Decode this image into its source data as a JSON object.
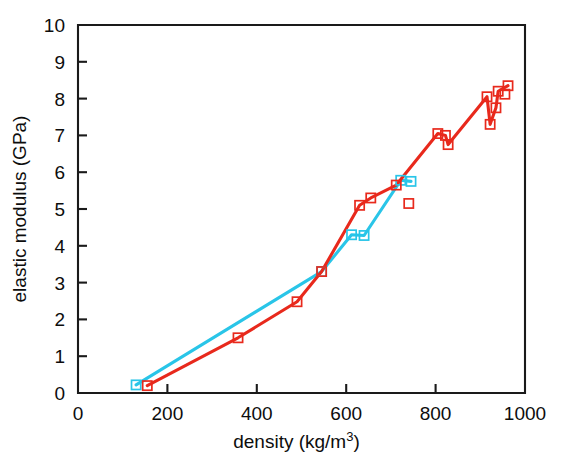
{
  "chart_data": {
    "type": "line",
    "title": "",
    "xlabel": "density (kg/m3)",
    "xlabel_base": "density (kg/m",
    "xlabel_sup": "3",
    "xlabel_tail": ")",
    "ylabel": "elastic modulus (GPa)",
    "xlim": [
      0,
      1000
    ],
    "ylim": [
      0,
      10
    ],
    "xticks": [
      0,
      200,
      400,
      600,
      800,
      1000
    ],
    "yticks": [
      0,
      1,
      2,
      3,
      4,
      5,
      6,
      7,
      8,
      9,
      10
    ],
    "xticklabels": [
      "0",
      "200",
      "400",
      "600",
      "800",
      "1000"
    ],
    "yticklabels": [
      "0",
      "1",
      "2",
      "3",
      "4",
      "5",
      "6",
      "7",
      "8",
      "9",
      "10"
    ],
    "grid": false,
    "legend": "none",
    "marker_shape": "open-square",
    "series": [
      {
        "name": "red-series",
        "color": "#E8291C",
        "points": [
          [
            155,
            0.2
          ],
          [
            358,
            1.5
          ],
          [
            490,
            2.48
          ],
          [
            545,
            3.3
          ],
          [
            630,
            5.1
          ],
          [
            655,
            5.3
          ],
          [
            712,
            5.65
          ],
          [
            740,
            5.15
          ],
          [
            805,
            7.05
          ],
          [
            822,
            7.0
          ],
          [
            828,
            6.75
          ],
          [
            915,
            8.05
          ],
          [
            922,
            7.3
          ],
          [
            935,
            7.75
          ],
          [
            940,
            8.2
          ],
          [
            955,
            8.12
          ],
          [
            962,
            8.35
          ]
        ],
        "path_order": [
          [
            155,
            0.2
          ],
          [
            358,
            1.5
          ],
          [
            490,
            2.48
          ],
          [
            545,
            3.3
          ],
          [
            630,
            5.1
          ],
          [
            655,
            5.3
          ],
          [
            712,
            5.65
          ],
          [
            805,
            7.05
          ],
          [
            822,
            7.0
          ],
          [
            828,
            6.75
          ],
          [
            915,
            8.05
          ],
          [
            922,
            7.3
          ],
          [
            935,
            7.75
          ],
          [
            940,
            8.2
          ],
          [
            962,
            8.35
          ]
        ],
        "isolated_points": [
          [
            740,
            5.15
          ],
          [
            955,
            8.12
          ]
        ]
      },
      {
        "name": "cyan-series",
        "color": "#29C5E8",
        "points": [
          [
            130,
            0.22
          ],
          [
            545,
            3.3
          ],
          [
            612,
            4.3
          ],
          [
            640,
            4.28
          ],
          [
            722,
            5.78
          ],
          [
            745,
            5.75
          ]
        ],
        "path_order": [
          [
            130,
            0.22
          ],
          [
            545,
            3.3
          ],
          [
            612,
            4.3
          ],
          [
            640,
            4.28
          ],
          [
            722,
            5.78
          ],
          [
            745,
            5.75
          ]
        ],
        "isolated_points": []
      }
    ]
  },
  "plot_geometry": {
    "left": 78,
    "right": 525,
    "top": 25,
    "bottom": 393
  }
}
